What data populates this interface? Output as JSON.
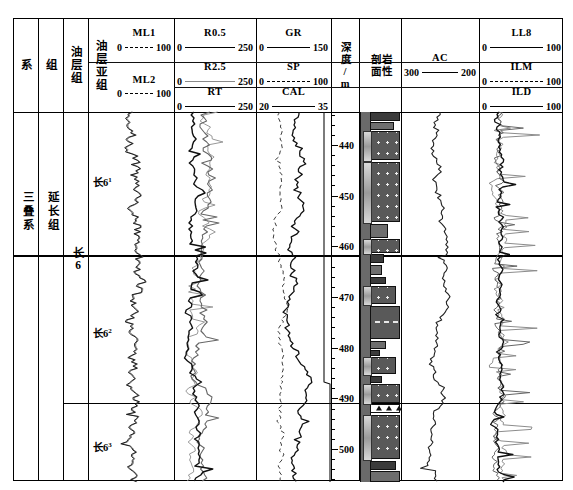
{
  "figure": {
    "kind": "well-log-composite",
    "width": 573,
    "height": 490
  },
  "strat_columns": [
    {
      "key": "xi",
      "header": "系",
      "value": "三叠系"
    },
    {
      "key": "zu",
      "header": "组",
      "value": "延长组"
    },
    {
      "key": "ycz",
      "header": "油层组",
      "value": "长6"
    },
    {
      "key": "yczz",
      "header": "油层亚组",
      "values": [
        "长6",
        "长6",
        "长6"
      ],
      "supers": [
        "1",
        "2",
        "3"
      ]
    }
  ],
  "tracks": [
    {
      "key": "track-ml",
      "name": "microlog-track",
      "curves": [
        {
          "name": "ML1",
          "lo": "0",
          "hi": "100",
          "style": "dashed",
          "color": "#000000"
        },
        {
          "name": "ML2",
          "lo": "0",
          "hi": "100",
          "style": "dashed",
          "color": "#000000"
        }
      ]
    },
    {
      "key": "track-res",
      "name": "resistivity-track",
      "curves": [
        {
          "name": "R0.5",
          "lo": "0",
          "hi": "250",
          "style": "solid",
          "color": "#000000"
        },
        {
          "name": "R2.5",
          "lo": "0",
          "hi": "250",
          "style": "solid",
          "color": "#8a8a8a"
        },
        {
          "name": "RT",
          "lo": "0",
          "hi": "250",
          "style": "solid",
          "color": "#000000"
        }
      ]
    },
    {
      "key": "track-grspcal",
      "name": "gr-sp-cal-track",
      "curves": [
        {
          "name": "GR",
          "lo": "0",
          "hi": "150",
          "style": "solid",
          "color": "#000000"
        },
        {
          "name": "SP",
          "lo": "0",
          "hi": "100",
          "style": "dashed",
          "color": "#000000"
        },
        {
          "name": "CAL",
          "lo": "20",
          "hi": "35",
          "style": "solid",
          "color": "#000000"
        }
      ]
    },
    {
      "key": "track-ac",
      "name": "sonic-track",
      "curves": [
        {
          "name": "AC",
          "lo": "300",
          "hi": "200",
          "style": "solid",
          "color": "#000000"
        }
      ]
    },
    {
      "key": "track-induction",
      "name": "induction-track",
      "curves": [
        {
          "name": "LL8",
          "lo": "0",
          "hi": "100",
          "style": "solid",
          "color": "#000000"
        },
        {
          "name": "ILM",
          "lo": "0",
          "hi": "100",
          "style": "dashed",
          "color": "#000000"
        },
        {
          "name": "ILD",
          "lo": "0",
          "hi": "100",
          "style": "solid",
          "color": "#000000"
        }
      ]
    }
  ],
  "depth_track": {
    "header_line1": "深",
    "header_line2": "度/",
    "header_line3": "m",
    "unit": "m",
    "labels": [
      "440",
      "450",
      "460",
      "470",
      "480",
      "490",
      "500"
    ],
    "top_depth": 433.5,
    "bottom_depth": 506.5,
    "minor_step": 2,
    "major_step": 10
  },
  "litho_track": {
    "header_line1": "岩性",
    "header_line2": "剖面"
  },
  "chart_data": {
    "type": "line",
    "title": "",
    "ylabel": "深度/m",
    "ylim": [
      433.5,
      506.5
    ],
    "depth_labels": [
      440,
      450,
      460,
      470,
      480,
      490,
      500
    ],
    "zone_boundaries": [
      {
        "label": "长6-1 / 长6-2",
        "depth": 461.5
      },
      {
        "label": "长6-2 / 长6-3",
        "depth": 490.8
      }
    ],
    "series": [
      {
        "name": "ML1",
        "track": "track-ml",
        "unit": "",
        "range": [
          0,
          100
        ]
      },
      {
        "name": "ML2",
        "track": "track-ml",
        "unit": "",
        "range": [
          0,
          100
        ]
      },
      {
        "name": "R0.5",
        "track": "track-res",
        "unit": "",
        "range": [
          0,
          250
        ]
      },
      {
        "name": "R2.5",
        "track": "track-res",
        "unit": "",
        "range": [
          0,
          250
        ]
      },
      {
        "name": "RT",
        "track": "track-res",
        "unit": "",
        "range": [
          0,
          250
        ]
      },
      {
        "name": "GR",
        "track": "track-grspcal",
        "unit": "API",
        "range": [
          0,
          150
        ]
      },
      {
        "name": "SP",
        "track": "track-grspcal",
        "unit": "mV",
        "range": [
          0,
          100
        ]
      },
      {
        "name": "CAL",
        "track": "track-grspcal",
        "unit": "cm",
        "range": [
          20,
          35
        ]
      },
      {
        "name": "AC",
        "track": "track-ac",
        "unit": "us/m",
        "range": [
          300,
          200
        ]
      },
      {
        "name": "LL8",
        "track": "track-induction",
        "unit": "",
        "range": [
          0,
          100
        ]
      },
      {
        "name": "ILM",
        "track": "track-induction",
        "unit": "",
        "range": [
          0,
          100
        ]
      },
      {
        "name": "ILD",
        "track": "track-induction",
        "unit": "",
        "range": [
          0,
          100
        ]
      }
    ]
  }
}
